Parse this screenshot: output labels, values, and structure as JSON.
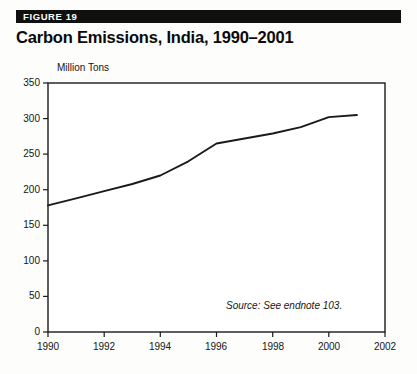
{
  "figure": {
    "label": "FIGURE 19",
    "title": "Carbon Emissions, India, 1990–2001",
    "source_note": "Source:  See endnote 103."
  },
  "colors": {
    "bar_background": "#101010",
    "bar_text": "#ffffff",
    "title": "#0a0a0a",
    "axis": "#1a1a1a",
    "line": "#1a1a1a",
    "plot_background": "#ffffff"
  },
  "chart_data": {
    "type": "line",
    "title": "Carbon Emissions, India, 1990–2001",
    "xlabel": "",
    "ylabel": "Million Tons",
    "ylim": [
      0,
      350
    ],
    "xlim": [
      1990,
      2002
    ],
    "ytick_labels": [
      "0",
      "50",
      "100",
      "150",
      "200",
      "250",
      "300",
      "350"
    ],
    "yticks": [
      0,
      50,
      100,
      150,
      200,
      250,
      300,
      350
    ],
    "xtick_labels": [
      "1990",
      "1992",
      "1994",
      "1996",
      "1998",
      "2000",
      "2002"
    ],
    "xticks": [
      1990,
      1992,
      1994,
      1996,
      1998,
      2000,
      2002
    ],
    "grid": false,
    "legend": "none",
    "annotations": [
      "Source:  See endnote 103."
    ],
    "series": [
      {
        "name": "Carbon Emissions",
        "x": [
          1990,
          1991,
          1992,
          1993,
          1994,
          1995,
          1996,
          1997,
          1998,
          1999,
          2000,
          2001
        ],
        "values": [
          178,
          188,
          198,
          208,
          220,
          240,
          265,
          272,
          279,
          288,
          302,
          305
        ]
      }
    ]
  }
}
